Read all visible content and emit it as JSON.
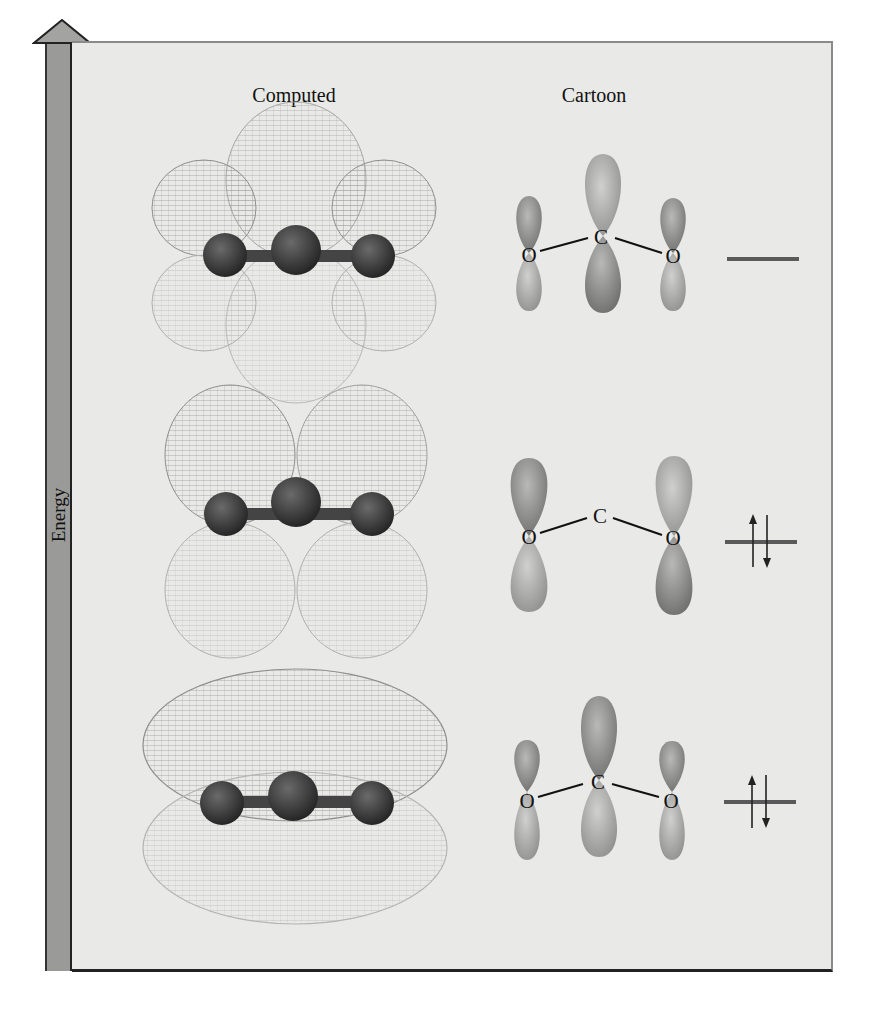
{
  "figure": {
    "axis": {
      "label": "Energy",
      "direction": "up"
    },
    "columns": [
      {
        "id": "computed",
        "label": "Computed",
        "x": 294
      },
      {
        "id": "cartoon",
        "label": "Cartoon",
        "x": 594
      }
    ],
    "molecule": "CO2",
    "levels": [
      {
        "position": "top",
        "description": "pi* antibonding (C-centered large lobe, O lobes opposite phase)",
        "cartoon_atoms": [
          "O",
          "C",
          "O"
        ],
        "electrons": 0,
        "occupancy": "empty"
      },
      {
        "position": "middle",
        "description": "pi nonbonding (O-only lobes, node at C)",
        "cartoon_atoms": [
          "O",
          "C",
          "O"
        ],
        "electrons": 2,
        "occupancy": "paired"
      },
      {
        "position": "bottom",
        "description": "pi bonding (all lobes in phase)",
        "cartoon_atoms": [
          "O",
          "C",
          "O"
        ],
        "electrons": 2,
        "occupancy": "paired"
      }
    ],
    "colors": {
      "panel_bg": "#e9e9e7",
      "energy_bar": "#9a9a98",
      "lobe": "#8c8c8a",
      "wireframe": "#8f8f8f",
      "atom": "#3a3a3a",
      "level_line": "#5a5a5a"
    }
  }
}
